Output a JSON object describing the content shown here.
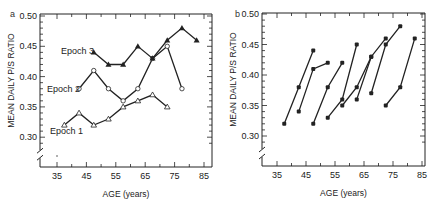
{
  "chart_data": [
    {
      "panel": "a",
      "type": "line",
      "title": "",
      "xlabel": "AGE (years)",
      "ylabel": "MEAN DAILY P/S RATIO",
      "xlim": [
        30,
        85
      ],
      "ylim": [
        0.27,
        0.5
      ],
      "x_ticks": [
        35,
        45,
        55,
        65,
        75,
        85
      ],
      "y_ticks": [
        0.3,
        0.35,
        0.4,
        0.45,
        0.5
      ],
      "y_axis_break": true,
      "grid": false,
      "series": [
        {
          "name": "Epoch 1",
          "marker": "open-triangle",
          "x": [
            37.5,
            42.5,
            47.5,
            52.5,
            57.5,
            62.5,
            67.5,
            72.5
          ],
          "values": [
            0.32,
            0.34,
            0.32,
            0.33,
            0.35,
            0.36,
            0.37,
            0.35
          ]
        },
        {
          "name": "Epoch 2",
          "marker": "open-circle",
          "x": [
            42.5,
            47.5,
            52.5,
            57.5,
            62.5,
            67.5,
            72.5,
            77.5
          ],
          "values": [
            0.38,
            0.41,
            0.38,
            0.36,
            0.38,
            0.43,
            0.45,
            0.38
          ]
        },
        {
          "name": "Epoch 3",
          "marker": "filled-triangle",
          "x": [
            47.5,
            52.5,
            57.5,
            62.5,
            67.5,
            72.5,
            77.5,
            82.5
          ],
          "values": [
            0.44,
            0.42,
            0.42,
            0.45,
            0.43,
            0.46,
            0.48,
            0.46
          ]
        }
      ]
    },
    {
      "panel": "b",
      "type": "line",
      "title": "",
      "xlabel": "AGE (years)",
      "ylabel": "MEAN DAILY P/S RATIO",
      "xlim": [
        30,
        85
      ],
      "ylim": [
        0.27,
        0.5
      ],
      "x_ticks": [
        35,
        45,
        55,
        65,
        75,
        85
      ],
      "y_ticks": [
        0.3,
        0.35,
        0.4,
        0.45,
        0.5
      ],
      "y_axis_break": true,
      "grid": false,
      "series": [
        {
          "name": "cohort 1",
          "marker": "filled-circle",
          "x": [
            37.5,
            42.5,
            47.5
          ],
          "values": [
            0.32,
            0.38,
            0.44
          ]
        },
        {
          "name": "cohort 2",
          "marker": "filled-circle",
          "x": [
            42.5,
            47.5,
            52.5
          ],
          "values": [
            0.34,
            0.41,
            0.42
          ]
        },
        {
          "name": "cohort 3",
          "marker": "filled-circle",
          "x": [
            47.5,
            52.5,
            57.5
          ],
          "values": [
            0.32,
            0.38,
            0.42
          ]
        },
        {
          "name": "cohort 4",
          "marker": "filled-circle",
          "x": [
            52.5,
            57.5,
            62.5
          ],
          "values": [
            0.33,
            0.36,
            0.45
          ]
        },
        {
          "name": "cohort 5",
          "marker": "filled-circle",
          "x": [
            57.5,
            62.5,
            67.5
          ],
          "values": [
            0.35,
            0.38,
            0.43
          ]
        },
        {
          "name": "cohort 6",
          "marker": "filled-circle",
          "x": [
            62.5,
            67.5,
            72.5
          ],
          "values": [
            0.36,
            0.43,
            0.46
          ]
        },
        {
          "name": "cohort 7",
          "marker": "filled-circle",
          "x": [
            67.5,
            72.5,
            77.5
          ],
          "values": [
            0.37,
            0.45,
            0.48
          ]
        },
        {
          "name": "cohort 8",
          "marker": "filled-circle",
          "x": [
            72.5,
            77.5,
            82.5
          ],
          "values": [
            0.35,
            0.38,
            0.46
          ]
        }
      ]
    }
  ],
  "panels": {
    "a": {
      "letter": "a",
      "series_labels": [
        "Epoch 1",
        "Epoch 2",
        "Epoch 3"
      ]
    },
    "b": {
      "letter": "b"
    }
  },
  "colors": {
    "ink": "#222222",
    "background": "#ffffff"
  }
}
